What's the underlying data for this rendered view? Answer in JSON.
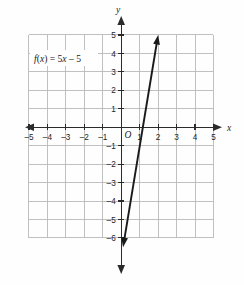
{
  "figure": {
    "name": "coordinate-plane-linear-function",
    "background_color": "#fefefe",
    "grid_color": "#b9b9b9",
    "axis_color": "#2b2b2b",
    "line_color": "#1a1a1a"
  },
  "labels": {
    "x_axis": "x",
    "y_axis": "y",
    "origin": "O",
    "function_text": "f(x) = 5x – 5",
    "function_fx": "f",
    "function_paren_open": "(",
    "function_var": "x",
    "function_paren_close": ")",
    "function_equals": " = 5",
    "function_var2": "x",
    "function_tail": " – 5"
  },
  "chart_data": {
    "type": "line",
    "title": "",
    "subtitle": "",
    "xlabel": "x",
    "ylabel": "y",
    "xlim": [
      -5,
      5
    ],
    "ylim": [
      -6,
      5
    ],
    "grid": true,
    "legend": "none",
    "annotations": [
      {
        "text": "f(x) = 5x – 5",
        "x": -3.6,
        "y": 3.6
      },
      {
        "text": "O",
        "x": 0.3,
        "y": -0.55
      }
    ],
    "xticks": [
      -5,
      -4,
      -3,
      -2,
      -1,
      1,
      2,
      3,
      4,
      5
    ],
    "xtick_labels": [
      "-5",
      "-4",
      "-3",
      "-2",
      "-1",
      "1",
      "2",
      "3",
      "4",
      "5"
    ],
    "yticks": [
      5,
      4,
      3,
      2,
      1,
      -1,
      -2,
      -3,
      -4,
      -5,
      -6
    ],
    "ytick_labels": [
      "5",
      "4",
      "3",
      "2",
      "1",
      "-1",
      "-2",
      "-3",
      "-4",
      "-5",
      "-6"
    ],
    "series": [
      {
        "name": "f(x) = 5x - 5",
        "equation": "y = 5x - 5",
        "slope": 5,
        "intercept": -5,
        "x_intercept": 1,
        "y_intercept": -5,
        "x": [
          0.1,
          2.0
        ],
        "y": [
          -4.5,
          5.0
        ],
        "arrow_start": [
          0.1,
          -6.5
        ],
        "arrow_end": [
          2.0,
          5.0
        ],
        "double_arrow": true
      }
    ]
  },
  "ticks": {
    "x": [
      {
        "value": -5,
        "label": "-5"
      },
      {
        "value": -4,
        "label": "-4"
      },
      {
        "value": -3,
        "label": "-3"
      },
      {
        "value": -2,
        "label": "-2"
      },
      {
        "value": -1,
        "label": "-1"
      },
      {
        "value": 1,
        "label": "1"
      },
      {
        "value": 2,
        "label": "2"
      },
      {
        "value": 3,
        "label": "3"
      },
      {
        "value": 4,
        "label": "4"
      },
      {
        "value": 5,
        "label": "5"
      }
    ],
    "y": [
      {
        "value": 5,
        "label": "5"
      },
      {
        "value": 4,
        "label": "4"
      },
      {
        "value": 3,
        "label": "3"
      },
      {
        "value": 2,
        "label": "2"
      },
      {
        "value": 1,
        "label": "1"
      },
      {
        "value": -1,
        "label": "-1"
      },
      {
        "value": -2,
        "label": "-2"
      },
      {
        "value": -3,
        "label": "-3"
      },
      {
        "value": -4,
        "label": "-4"
      },
      {
        "value": -5,
        "label": "-5"
      },
      {
        "value": -6,
        "label": "-6"
      }
    ]
  }
}
